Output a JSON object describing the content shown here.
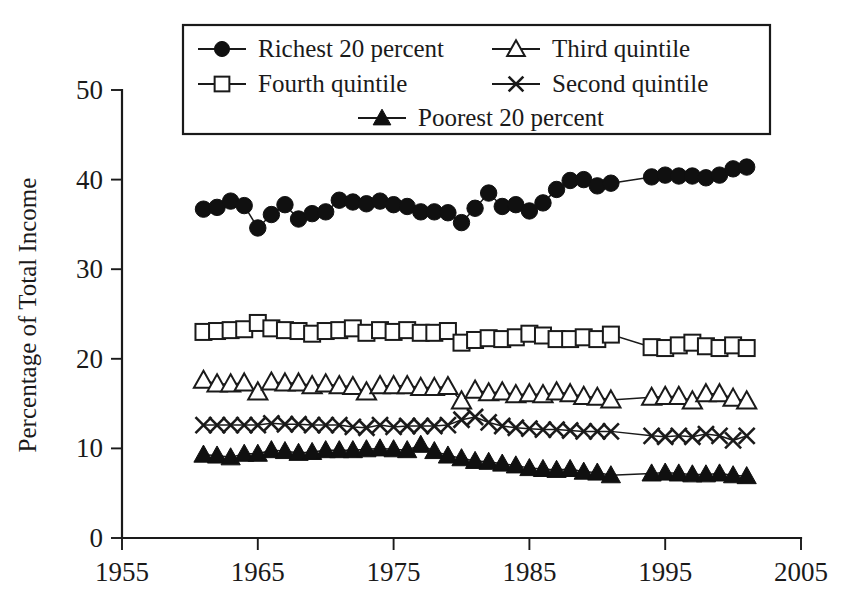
{
  "chart_data": {
    "type": "line",
    "title": "",
    "subtitle": "",
    "xlabel": "",
    "ylabel": "Percentage of Total Income",
    "xlim": [
      1955,
      2005
    ],
    "ylim": [
      0,
      50
    ],
    "xticks": [
      1955,
      1965,
      1975,
      1985,
      1995,
      2005
    ],
    "yticks": [
      0,
      10,
      20,
      30,
      40,
      50
    ],
    "xtick_labels": [
      "1955",
      "1965",
      "1975",
      "1985",
      "1995",
      "2005"
    ],
    "ytick_labels": [
      "0",
      "10",
      "20",
      "30",
      "40",
      "50"
    ],
    "grid": false,
    "legend_position": "top-center",
    "annotations": [],
    "x": [
      1961,
      1962,
      1963,
      1964,
      1965,
      1966,
      1967,
      1968,
      1969,
      1970,
      1971,
      1972,
      1973,
      1974,
      1975,
      1976,
      1977,
      1978,
      1979,
      1980,
      1981,
      1982,
      1983,
      1984,
      1985,
      1986,
      1987,
      1988,
      1989,
      1990,
      1991,
      1994,
      1995,
      1996,
      1997,
      1998,
      1999,
      2000,
      2001
    ],
    "series": [
      {
        "name": "Richest 20 percent",
        "marker": "filled-circle",
        "values": [
          36.7,
          36.9,
          37.6,
          37.1,
          34.6,
          36.1,
          37.2,
          35.6,
          36.2,
          36.4,
          37.7,
          37.5,
          37.3,
          37.6,
          37.2,
          37.0,
          36.4,
          36.4,
          36.3,
          35.2,
          36.8,
          38.5,
          37.0,
          37.2,
          36.5,
          37.4,
          38.9,
          39.9,
          40.0,
          39.3,
          39.6,
          40.3,
          40.5,
          40.4,
          40.4,
          40.2,
          40.5,
          41.2,
          41.4
        ]
      },
      {
        "name": "Fourth quintile",
        "marker": "open-square",
        "values": [
          23.0,
          23.1,
          23.2,
          23.3,
          24.0,
          23.4,
          23.2,
          23.1,
          22.8,
          23.1,
          23.2,
          23.4,
          22.9,
          23.2,
          23.0,
          23.2,
          22.9,
          22.9,
          23.1,
          21.8,
          22.1,
          22.3,
          22.2,
          22.4,
          22.8,
          22.6,
          22.2,
          22.2,
          22.4,
          22.2,
          22.7,
          21.3,
          21.2,
          21.5,
          21.8,
          21.4,
          21.2,
          21.5,
          21.2
        ]
      },
      {
        "name": "Third quintile",
        "marker": "open-triangle",
        "values": [
          17.6,
          17.2,
          17.2,
          17.3,
          16.3,
          17.4,
          17.3,
          17.3,
          17.0,
          17.2,
          17.0,
          16.9,
          16.3,
          17.0,
          17.0,
          17.0,
          16.8,
          16.8,
          16.9,
          15.3,
          16.5,
          16.2,
          16.3,
          16.0,
          16.1,
          16.0,
          16.3,
          16.1,
          15.8,
          15.7,
          15.4,
          15.7,
          15.8,
          15.8,
          15.3,
          16.1,
          16.1,
          15.6,
          15.3
        ]
      },
      {
        "name": "Second quintile",
        "marker": "cross",
        "values": [
          12.6,
          12.6,
          12.6,
          12.6,
          12.6,
          12.8,
          12.7,
          12.7,
          12.6,
          12.6,
          12.6,
          12.4,
          12.3,
          12.6,
          12.4,
          12.5,
          12.5,
          12.5,
          12.6,
          13.2,
          13.5,
          12.9,
          12.5,
          12.3,
          12.2,
          12.1,
          12.1,
          12.0,
          11.9,
          11.9,
          11.9,
          11.4,
          11.3,
          11.4,
          11.3,
          11.6,
          11.4,
          10.9,
          11.4
        ]
      },
      {
        "name": "Poorest 20 percent",
        "marker": "filled-triangle",
        "values": [
          9.3,
          9.2,
          9.0,
          9.4,
          9.4,
          9.8,
          9.7,
          9.5,
          9.6,
          9.8,
          9.8,
          9.8,
          9.9,
          10.0,
          9.9,
          9.8,
          10.4,
          9.7,
          9.2,
          8.9,
          8.6,
          8.5,
          8.3,
          8.1,
          7.8,
          7.7,
          7.6,
          7.7,
          7.4,
          7.3,
          7.0,
          7.2,
          7.3,
          7.2,
          7.1,
          7.1,
          7.2,
          7.0,
          6.9
        ]
      }
    ]
  },
  "legend": {
    "entries": [
      {
        "label": "Richest 20 percent",
        "marker": "filled-circle"
      },
      {
        "label": "Third quintile",
        "marker": "open-triangle"
      },
      {
        "label": "Fourth quintile",
        "marker": "open-square"
      },
      {
        "label": "Second quintile",
        "marker": "cross"
      },
      {
        "label": "Poorest 20 percent",
        "marker": "filled-triangle"
      }
    ]
  },
  "colors": {
    "ink": "#1a1a1a",
    "background": "#ffffff",
    "marker_fill": "#101010"
  }
}
